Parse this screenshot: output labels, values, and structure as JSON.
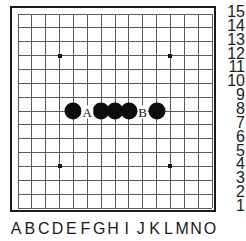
{
  "diagram": {
    "board": {
      "size": 15,
      "line_color": "#5a5a5a",
      "border_color": "#1a1a1a",
      "background_color": "#ffffff",
      "stone_color": "#0d0d0d",
      "star_color": "#111111"
    },
    "column_labels": [
      "A",
      "B",
      "C",
      "D",
      "E",
      "F",
      "G",
      "H",
      "I",
      "J",
      "K",
      "L",
      "M",
      "N",
      "O"
    ],
    "row_labels": [
      "15",
      "14",
      "13",
      "12",
      "11",
      "10",
      "9",
      "8",
      "7",
      "6",
      "5",
      "4",
      "3",
      "2",
      "1"
    ],
    "star_points": [
      {
        "col": 3,
        "row": 3
      },
      {
        "col": 11,
        "row": 3
      },
      {
        "col": 3,
        "row": 11
      },
      {
        "col": 11,
        "row": 11
      }
    ],
    "stones": [
      {
        "color": "black",
        "coord": "E8",
        "col": 4,
        "row": 7
      },
      {
        "color": "black",
        "coord": "G8",
        "col": 6,
        "row": 7
      },
      {
        "color": "black",
        "coord": "H8",
        "col": 7,
        "row": 7
      },
      {
        "color": "black",
        "coord": "I8",
        "col": 8,
        "row": 7
      },
      {
        "color": "black",
        "coord": "K8",
        "col": 10,
        "row": 7
      }
    ],
    "markers": [
      {
        "label": "A",
        "coord": "F8",
        "col": 5,
        "row": 7
      },
      {
        "label": "B",
        "coord": "J8",
        "col": 9,
        "row": 7
      }
    ]
  }
}
